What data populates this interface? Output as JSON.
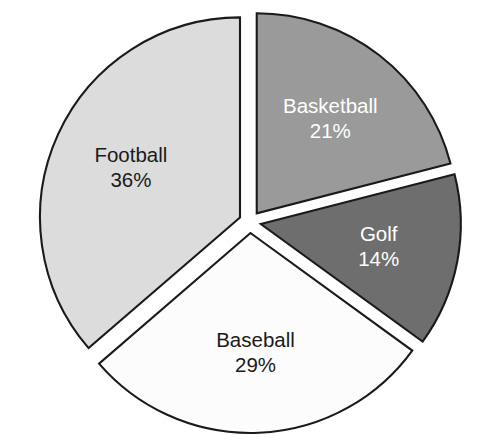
{
  "chart_data": {
    "type": "pie",
    "title": "",
    "subtitle": "",
    "xlabel": "",
    "ylabel": "",
    "legend_position": "none",
    "grid": false,
    "labels_inside_slices": true,
    "exploded": true,
    "background_color": "#ffffff",
    "outline_color": "#1a1a1a",
    "categories": [
      "Football",
      "Basketball",
      "Golf",
      "Baseball"
    ],
    "values": [
      36,
      21,
      14,
      29
    ],
    "value_unit": "%",
    "slices": [
      {
        "label": "Football",
        "value": 36,
        "value_text": "36%",
        "color": "#dcdcdc",
        "text_color": "#1a1a1a",
        "start_angle": 229.2,
        "end_angle": 360.0
      },
      {
        "label": "Basketball",
        "value": 21,
        "value_text": "21%",
        "color": "#9a9a9a",
        "text_color": "#ffffff",
        "start_angle": 0.0,
        "end_angle": 75.6
      },
      {
        "label": "Golf",
        "value": 14,
        "value_text": "14%",
        "color": "#6e6e6e",
        "text_color": "#ffffff",
        "start_angle": 75.6,
        "end_angle": 126.0
      },
      {
        "label": "Baseball",
        "value": 29,
        "value_text": "29%",
        "color": "#fcfcfc",
        "text_color": "#1a1a1a",
        "start_angle": 126.0,
        "end_angle": 229.2
      }
    ],
    "geometry": {
      "center_x": 250,
      "center_y": 222,
      "radius": 200,
      "explode_offset": 11
    }
  }
}
